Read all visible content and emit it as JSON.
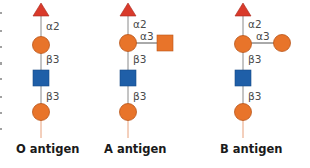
{
  "colors": {
    "fucose": "#d93a2b",
    "galactose": "#e8742a",
    "glcnac": "#1f5fa8",
    "galnac": "#e8742a",
    "stroke_orange": "#b9561a",
    "stroke_blue": "#174a85",
    "stroke_red": "#a82a1e",
    "stem": "#8a8a8a",
    "root_line": "#e8a07a"
  },
  "antigens": [
    {
      "name": "O antigen",
      "links": {
        "top": "α2",
        "mid": "β3",
        "low": "β3"
      },
      "branch": null
    },
    {
      "name": "A antigen",
      "links": {
        "top": "α2",
        "mid": "β3",
        "low": "β3",
        "branch": "α3"
      },
      "branch": {
        "shape": "square",
        "residue": "galnac"
      }
    },
    {
      "name": "B antigen",
      "links": {
        "top": "α2",
        "mid": "β3",
        "low": "β3",
        "branch": "α3"
      },
      "branch": {
        "shape": "circle",
        "residue": "galactose"
      }
    }
  ]
}
